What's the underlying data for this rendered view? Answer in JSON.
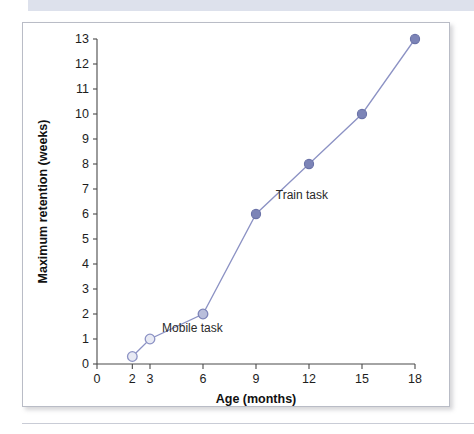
{
  "figure": {
    "top_band_color": "#dde1ec",
    "frame_border_color": "#b9bcc6",
    "background_color": "#ffffff"
  },
  "chart_data": {
    "type": "line",
    "title": "",
    "subtitle": "",
    "xlabel": "Age (months)",
    "ylabel": "Maximum retention (weeks)",
    "xlim": [
      0,
      18
    ],
    "ylim": [
      0,
      13
    ],
    "grid": false,
    "legend_position": "inline-annotations",
    "xticks": [
      0,
      2,
      3,
      6,
      9,
      12,
      15,
      18
    ],
    "xtick_labels": [
      "0",
      "2",
      "3",
      "6",
      "9",
      "12",
      "15",
      "18"
    ],
    "yticks": [
      0,
      1,
      2,
      3,
      4,
      5,
      6,
      7,
      8,
      9,
      10,
      11,
      12,
      13
    ],
    "ytick_labels": [
      "0",
      "1",
      "2",
      "3",
      "4",
      "5",
      "6",
      "7",
      "8",
      "9",
      "10",
      "11",
      "12",
      "13"
    ],
    "series": [
      {
        "name": "Retention",
        "line_color": "#8c92c4",
        "x": [
          2,
          3,
          6,
          9,
          12,
          15,
          18
        ],
        "values": [
          0.3,
          1,
          2,
          6,
          8,
          10,
          13
        ],
        "marker_styles": [
          "open",
          "open",
          "mid",
          "filled",
          "filled",
          "filled",
          "filled"
        ]
      }
    ],
    "annotations": [
      {
        "text": "Mobile task",
        "x": 5.4,
        "y": 1.3
      },
      {
        "text": "Train task",
        "x": 11.6,
        "y": 6.6
      }
    ]
  }
}
